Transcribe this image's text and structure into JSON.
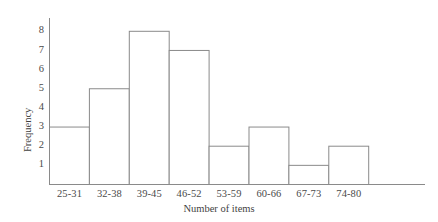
{
  "chart_data": {
    "type": "bar",
    "title": "",
    "subtitle": "",
    "xlabel": "Number of items",
    "ylabel": "Frequency",
    "categories": [
      "25-31",
      "32-38",
      "39-45",
      "46-52",
      "53-59",
      "60-66",
      "67-73",
      "74-80"
    ],
    "values": [
      3,
      5,
      8,
      7,
      2,
      3,
      1,
      2
    ],
    "yticks": [
      1,
      2,
      3,
      4,
      5,
      6,
      7,
      8
    ],
    "ytick_labels": [
      "1",
      "2",
      "3",
      "4",
      "5",
      "6",
      "7",
      "8"
    ],
    "ylim": [
      0,
      8.6
    ],
    "grid": false,
    "legend": false,
    "legend_position": "none",
    "style": {
      "bar_fill": "#ffffff",
      "bar_stroke": "#8a8a8a",
      "axis_color": "#8a8a8a",
      "text_color": "#444444",
      "background": "#ffffff"
    },
    "annotations": []
  },
  "axes": {
    "y_tick_1": "1",
    "y_tick_2": "2",
    "y_tick_3": "3",
    "y_tick_4": "4",
    "y_tick_5": "5",
    "y_tick_6": "6",
    "y_tick_7": "7",
    "y_tick_8": "8",
    "x_tick_0": "25-31",
    "x_tick_1": "32-38",
    "x_tick_2": "39-45",
    "x_tick_3": "46-52",
    "x_tick_4": "53-59",
    "x_tick_5": "60-66",
    "x_tick_6": "67-73",
    "x_tick_7": "74-80",
    "x_title": "Number of items",
    "y_title": "Frequency"
  }
}
